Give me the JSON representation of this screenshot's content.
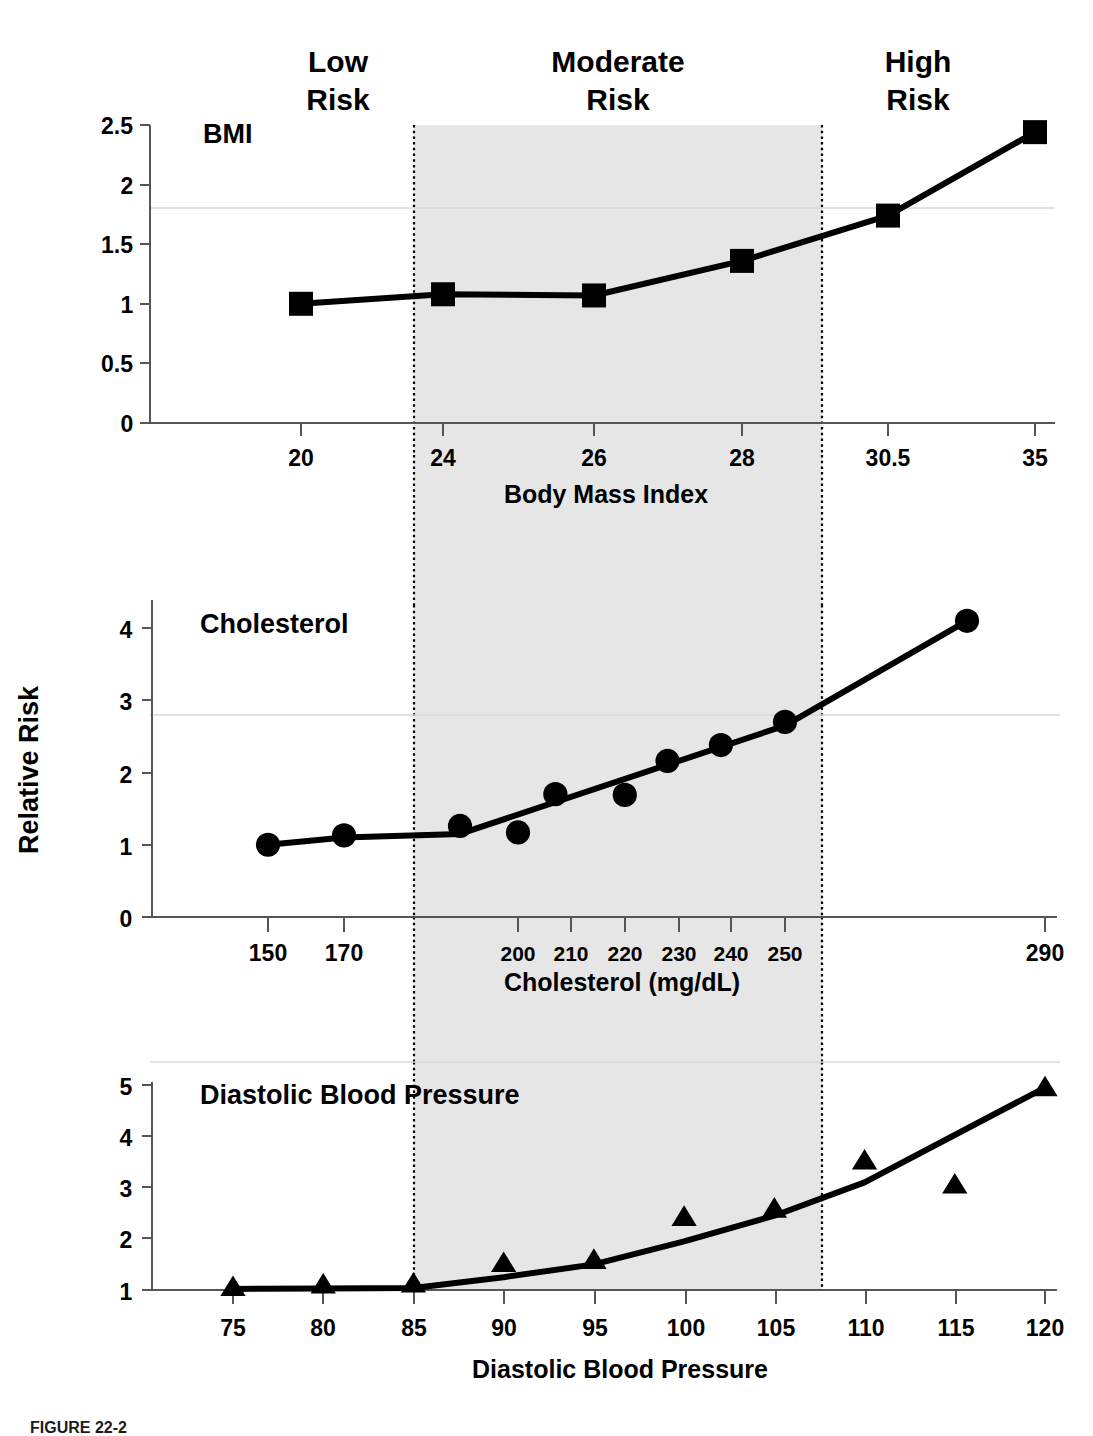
{
  "figure": {
    "caption": "FIGURE 22-2",
    "y_axis_title": "Relative Risk",
    "risk_bands": [
      {
        "id": "low",
        "label_line1": "Low",
        "label_line2": "Risk"
      },
      {
        "id": "moderate",
        "label_line1": "Moderate",
        "label_line2": "Risk"
      },
      {
        "id": "high",
        "label_line1": "High",
        "label_line2": "Risk"
      }
    ],
    "shade_color": "#e6e6e6",
    "line_color": "#000000"
  },
  "chart_data": [
    {
      "type": "line",
      "id": "bmi",
      "title": "BMI",
      "xlabel": "Body Mass Index",
      "ylabel": "Relative Risk",
      "marker": "square",
      "grid": false,
      "legend": "none",
      "ylim": [
        0,
        2.5
      ],
      "yticks": [
        "0",
        "0.5",
        "1",
        "1.5",
        "2",
        "2.5"
      ],
      "ytick_values": [
        0,
        0.5,
        1,
        1.5,
        2,
        2.5
      ],
      "categories": [
        "20",
        "24",
        "26",
        "28",
        "30.5",
        "35"
      ],
      "x": [
        20,
        24,
        26,
        28,
        30.5,
        35
      ],
      "values": [
        1.0,
        1.08,
        1.07,
        1.36,
        1.74,
        2.44
      ],
      "moderate_band_start": 23.6,
      "moderate_band_end": 29.4
    },
    {
      "type": "line",
      "id": "cholesterol",
      "title": "Cholesterol",
      "xlabel": "Cholesterol (mg/dL)",
      "ylabel": "Relative Risk",
      "marker": "circle",
      "grid": false,
      "legend": "none",
      "ylim": [
        0,
        4.4
      ],
      "yticks": [
        "0",
        "1",
        "2",
        "3",
        "4"
      ],
      "ytick_values": [
        0,
        1,
        2,
        3,
        4
      ],
      "categories": [
        "150",
        "170",
        "200",
        "210",
        "220",
        "230",
        "240",
        "250",
        "290"
      ],
      "x": [
        150,
        170,
        200,
        210,
        220,
        230,
        240,
        250,
        290
      ],
      "scatter_points": [
        {
          "x": 150,
          "y": 1.0
        },
        {
          "x": 170,
          "y": 1.13
        },
        {
          "x": 190,
          "y": 1.26
        },
        {
          "x": 200,
          "y": 1.17
        },
        {
          "x": 207,
          "y": 1.7
        },
        {
          "x": 220,
          "y": 1.69
        },
        {
          "x": 228,
          "y": 2.16
        },
        {
          "x": 238,
          "y": 2.38
        },
        {
          "x": 250,
          "y": 2.7
        },
        {
          "x": 278,
          "y": 4.1
        }
      ],
      "trend_x": [
        150,
        170,
        190,
        250,
        278
      ],
      "trend_y": [
        1.0,
        1.1,
        1.15,
        2.65,
        4.1
      ],
      "moderate_band_start": 185,
      "moderate_band_end": 257
    },
    {
      "type": "line",
      "id": "diastolic-blood-pressure",
      "title": "Diastolic Blood Pressure",
      "xlabel": "Diastolic Blood Pressure",
      "ylabel": "Relative Risk",
      "marker": "triangle",
      "grid": false,
      "legend": "none",
      "ylim": [
        1,
        5.2
      ],
      "yticks": [
        "1",
        "2",
        "3",
        "4",
        "5"
      ],
      "ytick_values": [
        1,
        2,
        3,
        4,
        5
      ],
      "categories": [
        "75",
        "80",
        "85",
        "90",
        "95",
        "100",
        "105",
        "110",
        "115",
        "120"
      ],
      "x": [
        75,
        80,
        85,
        90,
        95,
        100,
        105,
        110,
        115,
        120
      ],
      "scatter_points": [
        {
          "x": 75,
          "y": 1.05
        },
        {
          "x": 80,
          "y": 1.1
        },
        {
          "x": 85,
          "y": 1.12
        },
        {
          "x": 90,
          "y": 1.52
        },
        {
          "x": 95,
          "y": 1.58
        },
        {
          "x": 100,
          "y": 2.42
        },
        {
          "x": 105,
          "y": 2.58
        },
        {
          "x": 110,
          "y": 3.52
        },
        {
          "x": 115,
          "y": 3.05
        },
        {
          "x": 120,
          "y": 4.95
        }
      ],
      "trend_x": [
        75,
        80,
        85,
        90,
        95,
        100,
        105,
        110,
        120
      ],
      "trend_y": [
        1.02,
        1.03,
        1.04,
        1.25,
        1.5,
        1.95,
        2.45,
        3.1,
        4.95
      ],
      "moderate_band_start": 85,
      "moderate_band_end": 107.5
    }
  ]
}
